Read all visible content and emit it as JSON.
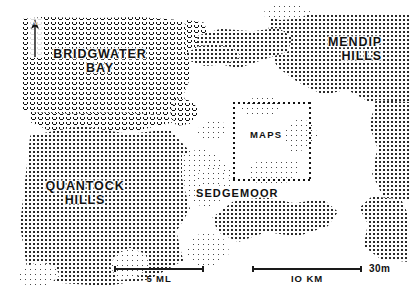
{
  "map": {
    "title": "Bridgwater Bay and Somerset Levels schematic map",
    "labels": {
      "bay": "BRIDGWATER\nBAY",
      "mendip": "MENDIP\nHILLS",
      "quantock": "QUANTOCK\nHILLS",
      "sedgemoor": "SEDGEMOOR",
      "inset_box": "MAPS",
      "corner_note": "30m"
    },
    "north_arrow": {
      "icon": "north-arrow-icon",
      "letter": "N"
    },
    "scales": [
      {
        "id": "miles",
        "label": "5 ML",
        "value": 5,
        "unit": "ML"
      },
      {
        "id": "kilometres",
        "label": "IO KM",
        "value": 10,
        "unit": "KM"
      }
    ],
    "legend_textures": [
      {
        "id": "sea",
        "name": "wave-hatch",
        "meaning": "sea / Bridgwater Bay"
      },
      {
        "id": "upland",
        "name": "stipple-dot",
        "meaning": "hills and higher ground"
      },
      {
        "id": "lowland",
        "name": "blank",
        "meaning": "low-lying moor / levels"
      }
    ],
    "colors": {
      "ink": "#111111",
      "paper": "#ffffff",
      "stipple": "#2a2a2a"
    }
  }
}
